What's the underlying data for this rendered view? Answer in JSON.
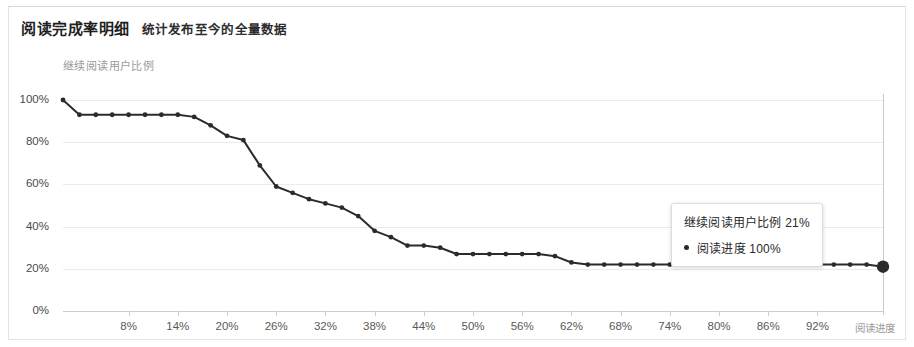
{
  "card": {
    "title": "阅读完成率明细",
    "subtitle": "统计发布至今的全量数据"
  },
  "tooltip": {
    "header": "继续阅读用户比例 21%",
    "marker": "bullet-dot",
    "row_label": "阅读进度 100%"
  },
  "colors": {
    "line": "#2b2b2b",
    "grid": "#ebebeb",
    "axis": "#cccccc",
    "card_border": "#e3e3e3",
    "tick_text": "#4a4a4a",
    "caption_text": "#9a9a9a"
  },
  "chart_data": {
    "type": "line",
    "title": "阅读完成率明细",
    "subtitle": "统计发布至今的全量数据",
    "xlabel": "阅读进度",
    "ylabel": "继续阅读用户比例",
    "xlim": [
      0,
      100
    ],
    "ylim": [
      0,
      100
    ],
    "grid": true,
    "legend": false,
    "y_ticks": [
      0,
      20,
      40,
      60,
      80,
      100
    ],
    "y_tick_labels": [
      "0%",
      "20%",
      "40%",
      "60%",
      "80%",
      "100%"
    ],
    "x_ticks": [
      8,
      14,
      20,
      26,
      32,
      38,
      44,
      50,
      56,
      62,
      68,
      74,
      80,
      86,
      92
    ],
    "x_tick_labels": [
      "8%",
      "14%",
      "20%",
      "26%",
      "32%",
      "38%",
      "44%",
      "50%",
      "56%",
      "62%",
      "68%",
      "74%",
      "80%",
      "86%",
      "92%"
    ],
    "series": [
      {
        "name": "继续阅读用户比例",
        "x": [
          0,
          2,
          4,
          6,
          8,
          10,
          12,
          14,
          16,
          18,
          20,
          22,
          24,
          26,
          28,
          30,
          32,
          34,
          36,
          38,
          40,
          42,
          44,
          46,
          48,
          50,
          52,
          54,
          56,
          58,
          60,
          62,
          64,
          66,
          68,
          70,
          72,
          74,
          76,
          78,
          80,
          82,
          84,
          86,
          88,
          90,
          92,
          94,
          96,
          98,
          100
        ],
        "values": [
          100,
          93,
          93,
          93,
          93,
          93,
          93,
          93,
          92,
          88,
          83,
          81,
          69,
          59,
          56,
          53,
          51,
          49,
          45,
          38,
          35,
          31,
          31,
          30,
          27,
          27,
          27,
          27,
          27,
          27,
          26,
          23,
          22,
          22,
          22,
          22,
          22,
          22,
          22,
          22,
          22,
          22,
          22,
          22,
          22,
          22,
          22,
          22,
          22,
          22,
          21
        ]
      }
    ],
    "highlight_point": {
      "x": 100,
      "y": 21,
      "label": "阅读进度 100%"
    }
  }
}
